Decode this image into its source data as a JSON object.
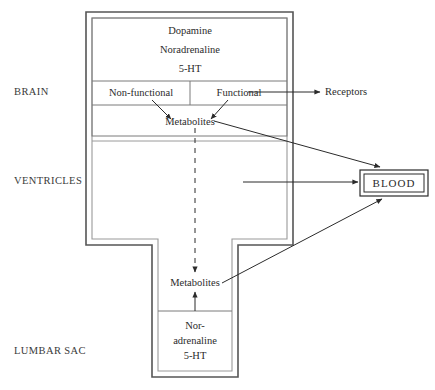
{
  "diagram": {
    "side_labels": [
      {
        "id": "brain",
        "text": "BRAIN"
      },
      {
        "id": "ventricles",
        "text": "VENTRICLES"
      },
      {
        "id": "lumbar-sac",
        "text": "LUMBAR SAC"
      }
    ],
    "brain_compartment": {
      "transmitters": [
        "Dopamine",
        "Noradrenaline",
        "5-HT"
      ],
      "pools": {
        "left": "Non-functional",
        "right": "Functional"
      },
      "metabolites": "Metabolites"
    },
    "external": {
      "receptors": "Receptors",
      "blood": "BLOOD"
    },
    "lumbar_compartment": {
      "metabolites": "Metabolites",
      "transmitters": [
        "Nor-",
        "adrenaline",
        "5-HT"
      ]
    },
    "colors": {
      "ink": "#2b2b2b",
      "wall": "#555555",
      "wall_light": "#8d8d8d",
      "divider": "#6f6f6f",
      "background": "#ffffff"
    }
  }
}
